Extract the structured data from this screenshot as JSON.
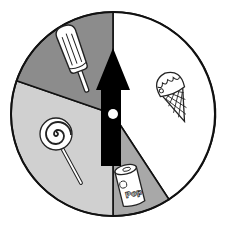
{
  "title": "Spinner with four treat sections",
  "spinner": {
    "center": [
      113,
      114
    ],
    "radius": 102,
    "sections": [
      {
        "id": "ice-cream-cone",
        "label": "Ice cream cone",
        "fill": "#ffffff",
        "start_deg": 0,
        "end_deg": 147
      },
      {
        "id": "soda-can",
        "label": "Pop",
        "fill": "#a8a8a8",
        "start_deg": 147,
        "end_deg": 180
      },
      {
        "id": "lollipop",
        "label": "Lollipop",
        "fill": "#d0d0d0",
        "start_deg": 180,
        "end_deg": 289
      },
      {
        "id": "popsicle",
        "label": "Popsicle",
        "fill": "#8c8c8c",
        "start_deg": 289,
        "end_deg": 360
      }
    ],
    "can_text": "Pop",
    "arrow": {
      "direction": "up",
      "color": "#000000"
    },
    "pivot_color": "#ffffff"
  }
}
